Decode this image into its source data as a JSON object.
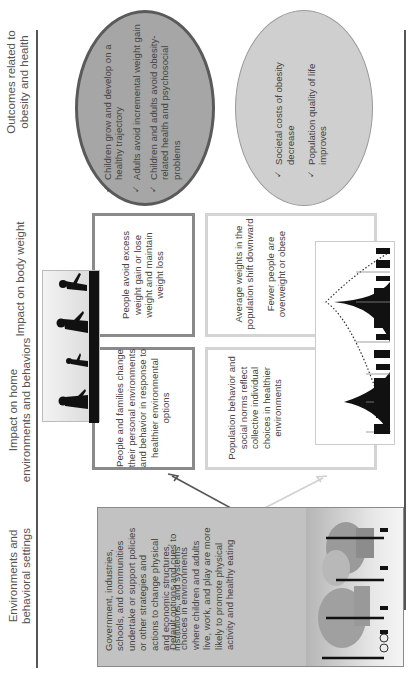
{
  "columns": {
    "environments": "Environments and behavioral settings",
    "environments_line1": "Environments and",
    "environments_line2": "behavioral settings",
    "home": "Impact on home environments and behaviors",
    "home_line1": "Impact on home",
    "home_line2": "environments and behaviors",
    "weight": "Impact on body weight",
    "outcomes_line1": "Outcomes related to",
    "outcomes_line2": "obesity and health"
  },
  "environment_box": {
    "paragraph1": "Government, industries, schools, and communities undertake or support policies or other strategies and actions to change physical and economic structures, institutions, and systems",
    "paragraph2": "Default options and cues to choices in environments where children and adults live, work, and play are more likely to promote physical activity and healthy eating",
    "illustration": "park-scene-with-trees-and-people"
  },
  "individual_path": {
    "home_box": "People and families change their personal environments and behavior in response to healthier environmental options",
    "weight_box": "People avoid excess weight gain or lose weight and maintain weight loss",
    "illustration": "silhouettes-walking-children-and-adults",
    "outcomes": [
      "Children grow and develop on a healthy trajectory",
      "Adults avoid incremental weight gain",
      "Children and adults avoid obesity-related health and psychosocial problems"
    ]
  },
  "population_path": {
    "home_box": "Population behavior and social norms reflect collective individual choices in healthier environments",
    "weight_box_line1": "Average weights in the population shift downward",
    "weight_box_line2": "Fewer people are overweight or obese",
    "illustration": "population-distribution-curves-with-people",
    "outcomes": [
      "Societal costs of obesity decrease",
      "Population quality of life improves"
    ]
  },
  "icons": {
    "check": "✓"
  },
  "colors": {
    "dark_path": "#8a8a8a",
    "light_path": "#d4d4d4",
    "dark_ellipse_fill": "#a6a6a6",
    "light_ellipse_fill": "#cfcfcf",
    "env_box_fill": "#c2c2c2"
  }
}
